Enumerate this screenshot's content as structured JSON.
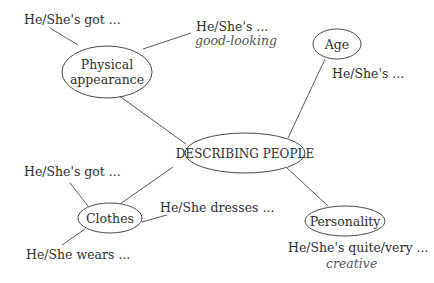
{
  "diagram": {
    "type": "mind-map",
    "center": {
      "label": "DESCRIBING PEOPLE"
    },
    "branches": [
      {
        "label_line1": "Physical",
        "label_line2": "appearance",
        "phrases": [
          "He/She's got ...",
          "He/She's ..."
        ],
        "example": "good-looking"
      },
      {
        "label": "Age",
        "phrases": [
          "He/She's ..."
        ]
      },
      {
        "label": "Clothes",
        "phrases": [
          "He/She's got ...",
          "He/She dresses ...",
          "He/She wears ..."
        ]
      },
      {
        "label": "Personality",
        "phrases": [
          "He/She's quite/very ..."
        ],
        "example": "creative"
      }
    ]
  },
  "colors": {
    "stroke": "#555555",
    "text": "#2e2e2e",
    "example_text": "#555555",
    "background": "#ffffff"
  }
}
